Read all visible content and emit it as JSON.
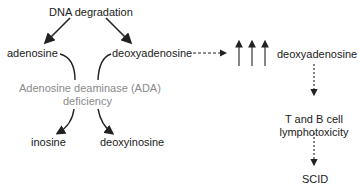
{
  "diagram": {
    "nodes": {
      "top": "DNA degradation",
      "left": "adenosine",
      "middle": "deoxyadenosine",
      "enzyme_line1": "Adenosine deaminase (ADA)",
      "enzyme_line2": "deficiency",
      "product_left": "inosine",
      "product_right": "deoxyinosine",
      "accumulated": "deoxyadenosine",
      "effect_line1": "T and B cell",
      "effect_line2": "lymphotoxicity",
      "outcome": "SCID"
    },
    "colors": {
      "text": "#1a1a1a",
      "enzyme_text": "#8a8a8a",
      "arrows": "#222222"
    },
    "increase_arrows_count": 3
  }
}
